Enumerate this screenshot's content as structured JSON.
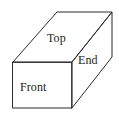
{
  "figure": {
    "kind": "3d-box-diagram",
    "background_color": "#ffffff",
    "line_color": "#2b2b2b",
    "text_color": "#1c1c1c",
    "faces": [
      {
        "id": "top",
        "label": "Top"
      },
      {
        "id": "end",
        "label": "End"
      },
      {
        "id": "front",
        "label": "Front"
      }
    ],
    "geometry": {
      "front_face_points": "13,62 72,62 72,108 13,108",
      "top_face_points": "13,62 57,12 112,12 72,62",
      "end_face_points": "72,62 112,12 112,57 72,108",
      "front_rect_path": "M13,62 L72,62 L72,108 L13,108 Z",
      "top_face_path": "M13,62 L57,12 L112,12 L72,62 Z",
      "end_face_path": "M72,62 L112,12 L112,57 L72,108 Z"
    }
  }
}
